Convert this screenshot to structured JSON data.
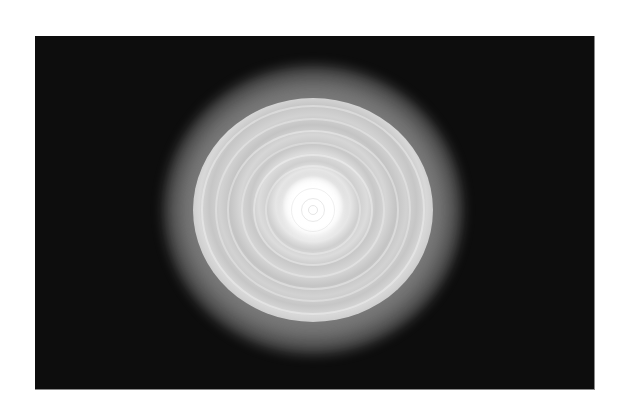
{
  "image": {
    "subject": "concentric-ring-light-pattern",
    "background_color": "#0d0d0d",
    "page_background": "#ffffff",
    "glow_color": "#ffffff",
    "frame": {
      "left": 35,
      "top": 36,
      "width": 559,
      "height": 353
    },
    "pattern_center": {
      "x": 313,
      "y": 210
    },
    "pattern_radius_x": 120,
    "pattern_radius_y": 112,
    "ring_count": 9
  }
}
